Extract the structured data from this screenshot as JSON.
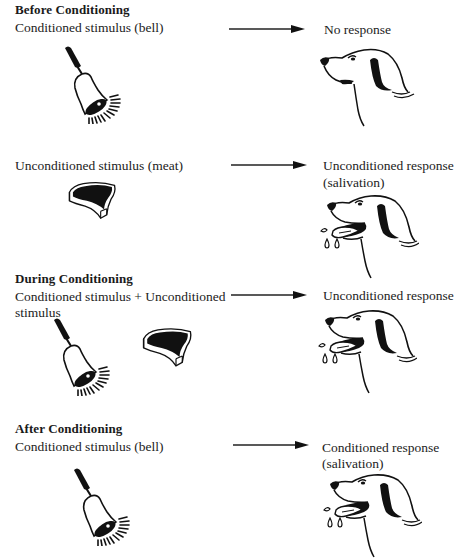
{
  "diagram": {
    "type": "classical-conditioning",
    "colors": {
      "ink": "#111111",
      "text": "#222222",
      "background": "#ffffff"
    },
    "sections": [
      {
        "heading": "Before Conditioning",
        "rows": [
          {
            "stimulus": "Conditioned stimulus (bell)",
            "stimulus_icons": [
              "bell-icon"
            ],
            "response_line1": "No response",
            "response_line2": "",
            "response_icon": "dog-head-neutral-icon"
          },
          {
            "stimulus": "Unconditioned stimulus (meat)",
            "stimulus_icons": [
              "meat-icon"
            ],
            "response_line1": "Unconditioned response",
            "response_line2": "(salivation)",
            "response_icon": "dog-head-salivating-icon"
          }
        ]
      },
      {
        "heading": "During Conditioning",
        "rows": [
          {
            "stimulus_line1": "Conditioned stimulus + Unconditioned",
            "stimulus_line2": "stimulus",
            "stimulus_icons": [
              "bell-icon",
              "meat-icon"
            ],
            "response_line1": "Unconditioned response",
            "response_icon": "dog-head-salivating-icon"
          }
        ]
      },
      {
        "heading": "After Conditioning",
        "rows": [
          {
            "stimulus": "Conditioned stimulus (bell)",
            "stimulus_icons": [
              "bell-icon"
            ],
            "response_line1": "Conditioned response",
            "response_line2": "(salivation)",
            "response_icon": "dog-head-salivating-icon"
          }
        ]
      }
    ]
  }
}
